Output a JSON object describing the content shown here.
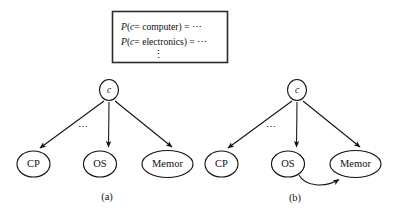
{
  "figure": {
    "prob_box": {
      "lines": [
        {
          "prefix": "P",
          "open": "(",
          "var": "c",
          "eq_in": "= ",
          "value": "computer",
          "close": ")",
          "tail": " = ⋯",
          "full": "P(c= computer) = ⋯"
        },
        {
          "prefix": "P",
          "open": "(",
          "var": "c",
          "eq_in": "= ",
          "value": "electronics",
          "close": ")",
          "tail": " = ⋯",
          "full": "P(c= electronics) = ⋯"
        }
      ],
      "vertical_ellipsis": "⋮"
    },
    "panels": [
      {
        "id": "a",
        "caption": "(a)",
        "root": {
          "label": "c",
          "italic": true
        },
        "leaves": [
          {
            "label": "CP"
          },
          {
            "label": "OS"
          },
          {
            "label": "Memor"
          }
        ],
        "ellipsis_marker": "⋯",
        "extra_edges": []
      },
      {
        "id": "b",
        "caption": "(b)",
        "root": {
          "label": "c",
          "italic": true
        },
        "leaves": [
          {
            "label": "CP"
          },
          {
            "label": "OS"
          },
          {
            "label": "Memor"
          }
        ],
        "ellipsis_marker": "⋯",
        "extra_edges": [
          {
            "from": "OS",
            "to": "Memor",
            "style": "curved"
          }
        ]
      }
    ],
    "colors": {
      "stroke": "#111111",
      "box_stroke": "#2b2b2b",
      "background": "#ffffff",
      "node_fill": "#ffffff"
    }
  }
}
